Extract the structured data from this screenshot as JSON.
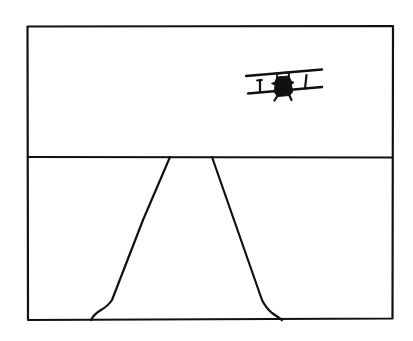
{
  "illustration": {
    "description": "Line drawing of a biplane flying over a road that narrows toward the horizon, inside a rectangular frame",
    "colors": {
      "background": "#ffffff",
      "ink": "#111111"
    },
    "frame": {
      "x1": 27,
      "y1": 26,
      "x2": 393,
      "y2": 320
    },
    "horizon_y": 157,
    "road": {
      "left_edge": [
        [
          170,
          157
        ],
        [
          143,
          220
        ],
        [
          112,
          300
        ],
        [
          105,
          308
        ],
        [
          91,
          320
        ]
      ],
      "right_edge": [
        [
          212,
          157
        ],
        [
          241,
          240
        ],
        [
          262,
          300
        ],
        [
          270,
          310
        ],
        [
          282,
          320
        ]
      ]
    },
    "biplane": {
      "upper_wing": [
        [
          246,
          76
        ],
        [
          322,
          70
        ]
      ],
      "lower_wing": [
        [
          248,
          93
        ],
        [
          322,
          87
        ]
      ],
      "left_strut": [
        [
          260,
          80
        ],
        [
          260,
          91
        ]
      ],
      "right_strut": [
        [
          306,
          75
        ],
        [
          305,
          88
        ]
      ],
      "fuselage_center": [
        283,
        86
      ]
    }
  }
}
